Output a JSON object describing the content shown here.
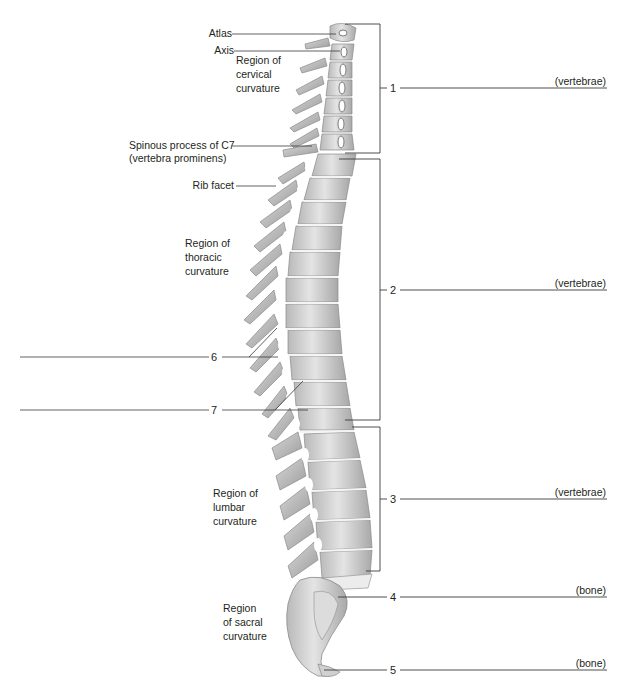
{
  "figure": {
    "type": "anatomical-diagram"
  },
  "labels": {
    "atlas": "Atlas",
    "axis": "Axis",
    "spinous_c7_line1": "Spinous process of C7",
    "spinous_c7_line2": "(vertebra prominens)",
    "rib_facet": "Rib facet"
  },
  "regions": {
    "cervical": [
      "Region of",
      "cervical",
      "curvature"
    ],
    "thoracic": [
      "Region of",
      "thoracic",
      "curvature"
    ],
    "lumbar": [
      "Region of",
      "lumbar",
      "curvature"
    ],
    "sacral": [
      "Region",
      "of sacral",
      "curvature"
    ]
  },
  "callouts": [
    {
      "number": "1",
      "hint": "(vertebrae)"
    },
    {
      "number": "2",
      "hint": "(vertebrae)"
    },
    {
      "number": "3",
      "hint": "(vertebrae)"
    },
    {
      "number": "4",
      "hint": "(bone)"
    },
    {
      "number": "5",
      "hint": "(bone)"
    },
    {
      "number": "6",
      "hint": ""
    },
    {
      "number": "7",
      "hint": ""
    }
  ],
  "colors": {
    "bone_light": "#e6e6e6",
    "bone_mid": "#c4c4c4",
    "bone_dark": "#8f8f8f",
    "line": "#3a3a3a"
  }
}
